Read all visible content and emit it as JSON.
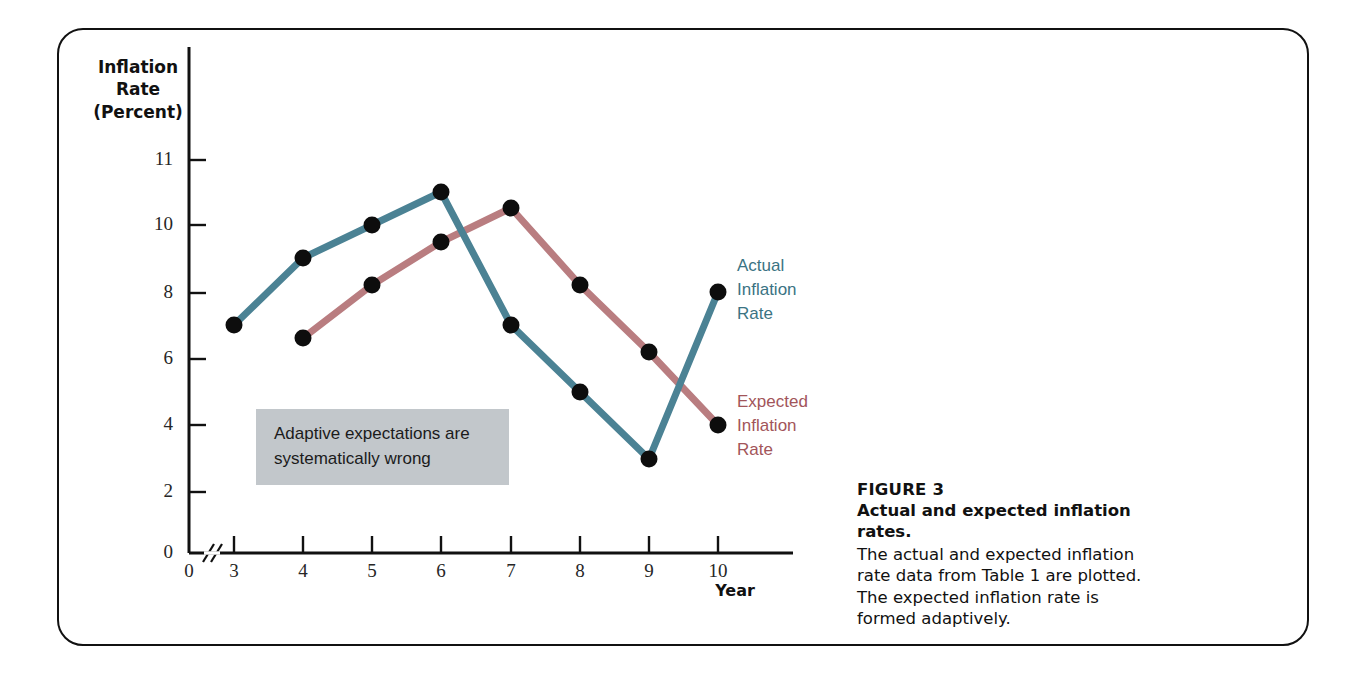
{
  "figure": {
    "number_label": "FIGURE 3",
    "title": "Actual and expected inflation rates.",
    "body": "The actual and expected inflation rate data from Table 1 are plotted. The expected inflation rate is formed adaptively."
  },
  "annotation": {
    "text": "Adaptive expectations are systematically wrong",
    "background_color": "#c2c7cb"
  },
  "legend": {
    "actual": "Actual\nInflation\nRate",
    "expected": "Expected\nInflation\nRate"
  },
  "chart_data": {
    "type": "line",
    "title": "Actual and expected inflation rates.",
    "xlabel": "Year",
    "ylabel": "Inflation Rate (Percent)",
    "x": [
      3,
      4,
      5,
      6,
      7,
      8,
      9,
      10
    ],
    "xtick_labels": [
      "0",
      "3",
      "4",
      "5",
      "6",
      "7",
      "8",
      "9",
      "10"
    ],
    "ytick_labels": [
      "0",
      "2",
      "4",
      "6",
      "8",
      "10",
      "11"
    ],
    "ytick_values": [
      0,
      2,
      4,
      6,
      8,
      10,
      11
    ],
    "ylim": [
      0,
      11
    ],
    "xlim": [
      3,
      10
    ],
    "axis_break_x": true,
    "grid": false,
    "legend_position": "right",
    "series": [
      {
        "name": "Actual Inflation Rate",
        "color": "#4b8294",
        "x": [
          3,
          4,
          5,
          6,
          7,
          8,
          9,
          10
        ],
        "values": [
          7.0,
          9.0,
          10.0,
          11.0,
          7.0,
          5.0,
          3.0,
          8.0
        ]
      },
      {
        "name": "Expected Inflation Rate",
        "color": "#b97d80",
        "x": [
          4,
          5,
          6,
          7,
          8,
          9,
          10
        ],
        "values": [
          6.7,
          8.3,
          9.45,
          10.5,
          8.3,
          6.2,
          4.0
        ]
      }
    ]
  },
  "colors": {
    "actual_line": "#4b8294",
    "expected_line": "#b97d80",
    "actual_text": "#3b7383",
    "expected_text": "#a2555a",
    "marker": "#0d0d0d",
    "axis": "#111111",
    "frame": "#111111"
  }
}
